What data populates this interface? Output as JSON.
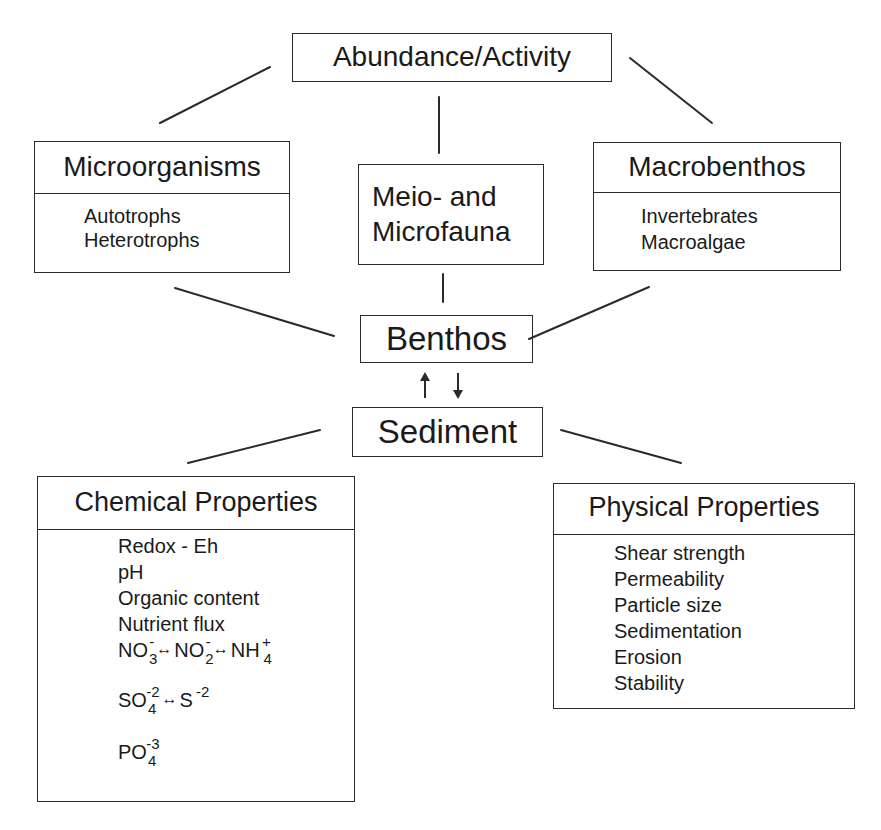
{
  "diagram": {
    "top": {
      "label": "Abundance/Activity"
    },
    "middle_row": [
      {
        "title": "Microorganisms",
        "items": [
          "Autotrophs",
          "Heterotrophs"
        ]
      },
      {
        "title_lines": [
          "Meio- and",
          "Microfauna"
        ]
      },
      {
        "title": "Macrobenthos",
        "items": [
          "Invertebrates",
          "Macroalgae"
        ]
      }
    ],
    "benthos": {
      "label": "Benthos"
    },
    "interaction_arrows": {
      "up": "↑",
      "down": "↓"
    },
    "sediment": {
      "label": "Sediment"
    },
    "chemical": {
      "title": "Chemical Properties",
      "items": [
        "Redox - Eh",
        "pH",
        "Organic content",
        "Nutrient flux"
      ],
      "formulas": {
        "nitrogen": [
          {
            "base": "NO",
            "sub": "3",
            "sup": "-"
          },
          {
            "arrow": "↔"
          },
          {
            "base": "NO",
            "sub": "2",
            "sup": "-"
          },
          {
            "arrow": "↔"
          },
          {
            "base": "NH",
            "sub": "4",
            "sup": "+"
          }
        ],
        "sulfur": [
          {
            "base": "SO",
            "sub": "4",
            "sup": "-2"
          },
          {
            "arrow": "↔"
          },
          {
            "base": "S",
            "sub": "",
            "sup": "-2"
          }
        ],
        "phosphate": [
          {
            "base": "PO",
            "sub": "4",
            "sup": "-3"
          }
        ]
      }
    },
    "physical": {
      "title": "Physical Properties",
      "items": [
        "Shear strength",
        "Permeability",
        "Particle size",
        "Sedimentation",
        "Erosion",
        "Stability"
      ]
    },
    "line_color": "#2a2a2a"
  }
}
